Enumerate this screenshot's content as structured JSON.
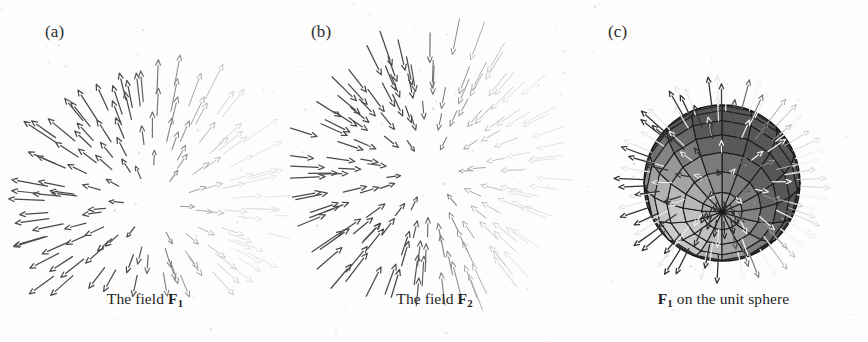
{
  "figure": {
    "background_color": "#fdfdfd",
    "width": 868,
    "height": 342,
    "ink_color": "#4a4a4a",
    "faded_ink_color": "#c9c9c9"
  },
  "panels": [
    {
      "id": "a",
      "label": "(a)",
      "label_x": 45,
      "label_y": 22,
      "caption_prefix": "The field ",
      "caption_symbol": "F",
      "caption_subscript": "1",
      "caption_suffix": "",
      "caption_y": 290,
      "origin_x": 290,
      "plot_center_x": 152,
      "plot_center_y": 205,
      "plot_radius": 112,
      "field_type": "source",
      "arrow_count": 150,
      "fade_axis": "right"
    },
    {
      "id": "b",
      "label": "(b)",
      "label_x": 311,
      "label_y": 22,
      "caption_prefix": "The field ",
      "caption_symbol": "F",
      "caption_subscript": "2",
      "caption_suffix": "",
      "caption_y": 290,
      "origin_x": 289,
      "plot_center_x": 139,
      "plot_center_y": 172,
      "plot_radius": 108,
      "field_type": "sink",
      "arrow_count": 150,
      "fade_axis": "right"
    },
    {
      "id": "c",
      "label": "(c)",
      "label_x": 608,
      "label_y": 22,
      "caption_prefix": "",
      "caption_symbol": "F",
      "caption_subscript": "1",
      "caption_suffix": " on the unit sphere",
      "caption_y": 290,
      "origin_x": 289,
      "plot_center_x": 143,
      "plot_center_y": 183,
      "plot_radius": 78,
      "field_type": "sphere",
      "arrow_count": 120,
      "fade_axis": "right"
    }
  ],
  "chart_data": {
    "type": "scatter",
    "title": "",
    "subtitle": "",
    "xlabel": "",
    "ylabel": "",
    "grid": false,
    "legend_position": "none",
    "series": [
      {
        "name": "F1",
        "panel": "a",
        "field": "radial outward",
        "sample_count": 150,
        "arrow_direction": "outward from origin",
        "magnitude_rule": "proportional to radius"
      },
      {
        "name": "F2",
        "panel": "b",
        "field": "radial inward",
        "sample_count": 150,
        "arrow_direction": "inward toward origin",
        "magnitude_rule": "proportional to radius"
      },
      {
        "name": "F1 on unit sphere",
        "panel": "c",
        "field": "radial outward normal to sphere",
        "sample_count": 120,
        "arrow_direction": "outward normal",
        "magnitude_rule": "unit length",
        "mesh_latitudes": 12,
        "mesh_longitudes": 16,
        "sphere_shading": "upper-left highlight"
      }
    ]
  },
  "sphere": {
    "latitudes": 12,
    "longitudes": 16,
    "grid_color": "#1a1a1a",
    "fill_dark": "#3e3e3e",
    "fill_light": "#b8b8b8",
    "highlight_color": "#d8d8d8",
    "arrow_light_color": "#f2f2f2",
    "arrow_dark_color": "#4a4a4a"
  }
}
